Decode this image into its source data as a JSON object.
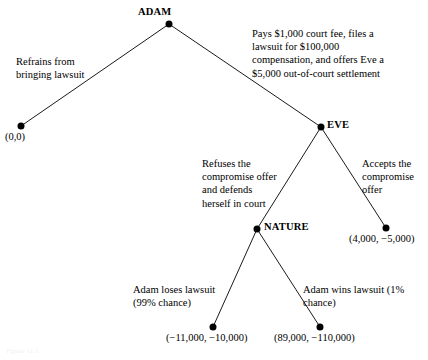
{
  "diagram": {
    "type": "game-tree",
    "background_color": "#ffffff",
    "line_color": "#000000",
    "node_color": "#000000",
    "caption": "Figure 12.1"
  },
  "nodes": [
    {
      "id": "adam",
      "label": "ADAM",
      "x": 169,
      "y": 24,
      "kind": "decision",
      "label_dx": -31,
      "label_dy": -18
    },
    {
      "id": "eve",
      "label": "EVE",
      "x": 321,
      "y": 127,
      "kind": "decision",
      "label_dx": 6,
      "label_dy": -8
    },
    {
      "id": "nature",
      "label": "NATURE",
      "x": 257,
      "y": 229,
      "kind": "chance",
      "label_dx": 7,
      "label_dy": -8
    }
  ],
  "terminals": [
    {
      "id": "t-refrain",
      "payoff": "(0,0)",
      "x": 21,
      "y": 126,
      "label_dx": -16,
      "label_dy": 5
    },
    {
      "id": "t-accept",
      "payoff": "(4,000, −5,000)",
      "x": 386,
      "y": 228,
      "label_dx": -37,
      "label_dy": 5
    },
    {
      "id": "t-lose",
      "payoff": "(−11,000, −10,000)",
      "x": 213,
      "y": 327,
      "label_dx": -47,
      "label_dy": 5
    },
    {
      "id": "t-win",
      "payoff": "(89,000, −110,000)",
      "x": 320,
      "y": 327,
      "label_dx": -46,
      "label_dy": 5
    }
  ],
  "edges": [
    {
      "id": "adam-refrains",
      "from": "adam",
      "to": "t-refrain"
    },
    {
      "id": "adam-sues",
      "from": "adam",
      "to": "eve"
    },
    {
      "id": "eve-refuses",
      "from": "eve",
      "to": "nature"
    },
    {
      "id": "eve-accepts",
      "from": "eve",
      "to": "t-accept"
    },
    {
      "id": "nature-loses",
      "from": "nature",
      "to": "t-lose"
    },
    {
      "id": "nature-wins",
      "from": "nature",
      "to": "t-win"
    }
  ],
  "edge_labels": {
    "adam_refrains": "Refrains from\nbringing lawsuit",
    "adam_sues": "Pays $1,000 court fee, files a\nlawsuit for $100,000\ncompensation, and offers Eve a\n$5,000 out-of-court settlement",
    "eve_refuses": "Refuses the\ncompromise offer\nand defends\nherself in court",
    "eve_accepts": "Accepts the\ncompromise\noffer",
    "nature_loses": "Adam loses lawsuit\n(99% chance)",
    "nature_wins": "Adam wins lawsuit  (1%\nchance)"
  }
}
